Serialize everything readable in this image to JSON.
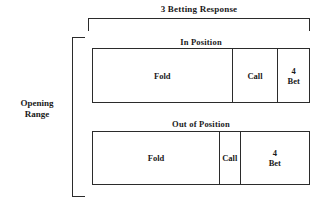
{
  "title": "3 Betting Response",
  "side_label_line1": "Opening",
  "side_label_line2": "Range",
  "rows": [
    {
      "heading": "In Position",
      "cells": [
        {
          "label": "Fold",
          "label2": "",
          "width_pct": 64.2
        },
        {
          "label": "Call",
          "label2": "",
          "width_pct": 21.1
        },
        {
          "label": "4",
          "label2": "Bet",
          "width_pct": 14.7
        }
      ]
    },
    {
      "heading": "Out of Position",
      "cells": [
        {
          "label": "Fold",
          "label2": "",
          "width_pct": 58.3
        },
        {
          "label": "Call",
          "label2": "",
          "width_pct": 9.6
        },
        {
          "label": "4",
          "label2": "Bet",
          "width_pct": 32.1
        }
      ]
    }
  ],
  "colors": {
    "line": "#2b2b2b",
    "text": "#1a1a1a",
    "background": "#ffffff"
  }
}
